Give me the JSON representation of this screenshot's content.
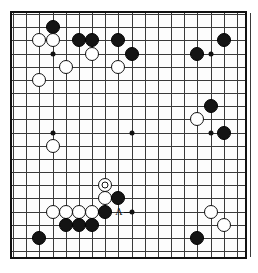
{
  "figure": {
    "kind": "go-board-diagram",
    "board_size": 19,
    "colors": {
      "black_stone": "#141414",
      "white_stone": "#ffffff",
      "line": "#3a3a3a",
      "border": "#111111",
      "background": "#fdfdfd"
    },
    "geometry": {
      "origin_x": 10,
      "origin_y": 11,
      "spacing": 13.17,
      "stone_diameter": 14
    }
  },
  "star_points": [
    {
      "col": 4,
      "row": 4
    },
    {
      "col": 10,
      "row": 4
    },
    {
      "col": 16,
      "row": 4
    },
    {
      "col": 4,
      "row": 10
    },
    {
      "col": 10,
      "row": 10
    },
    {
      "col": 16,
      "row": 10
    },
    {
      "col": 4,
      "row": 16
    },
    {
      "col": 10,
      "row": 16
    },
    {
      "col": 16,
      "row": 16
    }
  ],
  "stones": [
    {
      "color": "black",
      "col": 4,
      "row": 2,
      "marked": false
    },
    {
      "color": "white",
      "col": 3,
      "row": 3,
      "marked": false
    },
    {
      "color": "white",
      "col": 4,
      "row": 3,
      "marked": false
    },
    {
      "color": "black",
      "col": 6,
      "row": 3,
      "marked": false
    },
    {
      "color": "black",
      "col": 7,
      "row": 3,
      "marked": false
    },
    {
      "color": "black",
      "col": 9,
      "row": 3,
      "marked": false
    },
    {
      "color": "black",
      "col": 17,
      "row": 3,
      "marked": false
    },
    {
      "color": "white",
      "col": 7,
      "row": 4,
      "marked": false
    },
    {
      "color": "black",
      "col": 10,
      "row": 4,
      "marked": false
    },
    {
      "color": "black",
      "col": 15,
      "row": 4,
      "marked": false
    },
    {
      "color": "white",
      "col": 5,
      "row": 5,
      "marked": false
    },
    {
      "color": "white",
      "col": 9,
      "row": 5,
      "marked": false
    },
    {
      "color": "white",
      "col": 3,
      "row": 6,
      "marked": false
    },
    {
      "color": "black",
      "col": 16,
      "row": 8,
      "marked": false
    },
    {
      "color": "white",
      "col": 15,
      "row": 9,
      "marked": false
    },
    {
      "color": "black",
      "col": 17,
      "row": 10,
      "marked": false
    },
    {
      "color": "white",
      "col": 4,
      "row": 11,
      "marked": false
    },
    {
      "color": "white",
      "col": 8,
      "row": 14,
      "marked": true
    },
    {
      "color": "white",
      "col": 8,
      "row": 15,
      "marked": false
    },
    {
      "color": "black",
      "col": 9,
      "row": 15,
      "marked": false
    },
    {
      "color": "white",
      "col": 4,
      "row": 16,
      "marked": false
    },
    {
      "color": "white",
      "col": 5,
      "row": 16,
      "marked": false
    },
    {
      "color": "white",
      "col": 6,
      "row": 16,
      "marked": false
    },
    {
      "color": "white",
      "col": 7,
      "row": 16,
      "marked": false
    },
    {
      "color": "black",
      "col": 8,
      "row": 16,
      "marked": false
    },
    {
      "color": "white",
      "col": 16,
      "row": 16,
      "marked": false
    },
    {
      "color": "black",
      "col": 5,
      "row": 17,
      "marked": false
    },
    {
      "color": "black",
      "col": 6,
      "row": 17,
      "marked": false
    },
    {
      "color": "black",
      "col": 7,
      "row": 17,
      "marked": false
    },
    {
      "color": "white",
      "col": 17,
      "row": 17,
      "marked": false
    },
    {
      "color": "black",
      "col": 3,
      "row": 18,
      "marked": false
    },
    {
      "color": "black",
      "col": 15,
      "row": 18,
      "marked": false
    }
  ],
  "labels": [
    {
      "text": "A",
      "col": 9,
      "row": 16,
      "has_tick": true
    }
  ]
}
